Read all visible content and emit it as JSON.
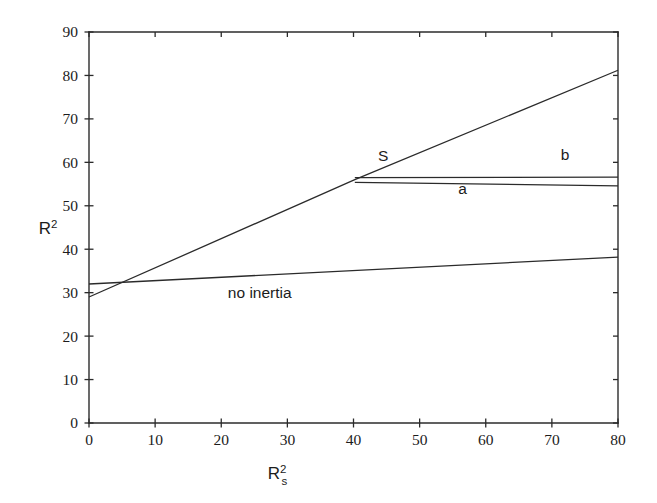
{
  "chart_data": {
    "type": "line",
    "title": "",
    "xlabel": "R_s^2",
    "xlabel_base": "R",
    "xlabel_sub": "s",
    "xlabel_sup": "2",
    "ylabel": "R^2",
    "ylabel_base": "R",
    "ylabel_sup": "2",
    "xlim": [
      0,
      80
    ],
    "ylim": [
      0,
      90
    ],
    "xticks": [
      0,
      10,
      20,
      30,
      40,
      50,
      60,
      70,
      80
    ],
    "xtick_labels": [
      "0",
      "10",
      "20",
      "30",
      "40",
      "50",
      "60",
      "70",
      "80"
    ],
    "yticks": [
      0,
      10,
      20,
      30,
      40,
      50,
      60,
      70,
      80,
      90
    ],
    "ytick_labels": [
      "0",
      "10",
      "20",
      "30",
      "40",
      "50",
      "60",
      "70",
      "80",
      "90"
    ],
    "grid": false,
    "legend_position": "inline-annotations",
    "line_color": "#2b2b2b",
    "series": [
      {
        "name": "S",
        "label": "S",
        "label_x": 44.5,
        "label_y": 60.3,
        "x": [
          0,
          40.2,
          80
        ],
        "values": [
          29,
          56,
          81.2
        ]
      },
      {
        "name": "b",
        "label": "b",
        "label_x": 72.0,
        "label_y": 60.5,
        "x": [
          40.2,
          80
        ],
        "values": [
          56.5,
          56.6
        ]
      },
      {
        "name": "a",
        "label": "a",
        "label_x": 56.5,
        "label_y": 52.7,
        "x": [
          40.2,
          80
        ],
        "values": [
          55.4,
          54.6
        ]
      },
      {
        "name": "no inertia",
        "label": "no inertia",
        "label_x": 21.0,
        "label_y": 28.7,
        "x": [
          0,
          80
        ],
        "values": [
          32.0,
          38.2
        ]
      }
    ]
  }
}
